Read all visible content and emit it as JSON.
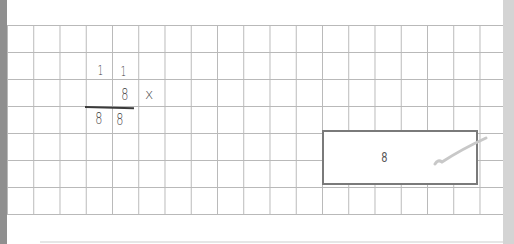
{
  "worksheet": {
    "carries": [
      "1",
      "1"
    ],
    "multiplier": "8",
    "operator": "x",
    "result_digits": [
      "8",
      "8"
    ]
  },
  "answer_box": {
    "value": "8",
    "mark": "checkmark"
  },
  "colors": {
    "grid_line": "#b9b9b9",
    "left_bar": "#8f8f8f",
    "right_bar": "#d4d4d4",
    "box_border": "#7a7a7a",
    "check_mark": "#c8c8c8"
  }
}
